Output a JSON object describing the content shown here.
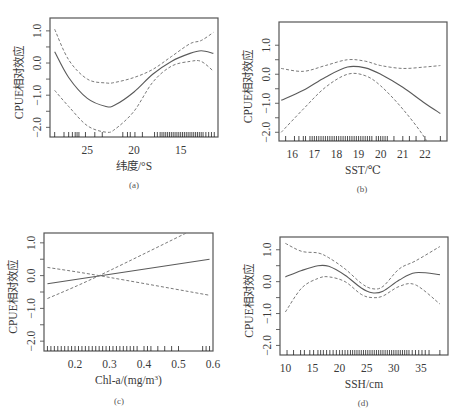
{
  "figure": {
    "captions": [
      "(a)",
      "(b)",
      "(c)",
      "(d)"
    ]
  },
  "chart_data": [
    {
      "type": "line",
      "panel": "(a)",
      "xlabel": "纬度/°S",
      "ylabel": "CPUE相对效应",
      "x_ticks": [
        25,
        20,
        15
      ],
      "y_ticks": [
        "-2.0",
        "-1.0",
        "0.0",
        "1.0"
      ],
      "x_reversed": true,
      "xlim": [
        29,
        11
      ],
      "ylim": [
        -2.3,
        1.4
      ],
      "series": [
        {
          "name": "fit",
          "x": [
            28.5,
            27,
            25,
            23,
            22,
            20,
            18,
            16,
            14,
            12.8,
            11.5
          ],
          "values": [
            0.35,
            -0.45,
            -1.1,
            -1.35,
            -1.3,
            -0.9,
            -0.35,
            0.05,
            0.3,
            0.38,
            0.3
          ]
        },
        {
          "name": "upper",
          "x": [
            28.5,
            27,
            25,
            23,
            22,
            20,
            18,
            16,
            14,
            12.8,
            11.5
          ],
          "values": [
            1.05,
            0.1,
            -0.5,
            -0.62,
            -0.6,
            -0.45,
            -0.2,
            0.2,
            0.6,
            0.7,
            0.95
          ]
        },
        {
          "name": "lower",
          "x": [
            28.5,
            27,
            25,
            23,
            22,
            20,
            18,
            16,
            14,
            12.8,
            11.5
          ],
          "values": [
            -0.85,
            -1.35,
            -1.95,
            -2.15,
            -2.05,
            -1.5,
            -0.6,
            -0.1,
            0.05,
            0.05,
            -0.25
          ]
        }
      ],
      "rug": "dense 17-11, sparse 28-19"
    },
    {
      "type": "line",
      "panel": "(b)",
      "xlabel": "SST/℃",
      "ylabel": "CPUE相对效应",
      "x_ticks": [
        16,
        17,
        18,
        19,
        20,
        21,
        22
      ],
      "y_ticks": [
        "-2.0",
        "-1.0",
        "0.0",
        "1.0"
      ],
      "xlim": [
        15.4,
        23
      ],
      "ylim": [
        -2.3,
        1.8
      ],
      "series": [
        {
          "name": "fit",
          "x": [
            15.5,
            16.5,
            17.5,
            18.5,
            19.3,
            20,
            21,
            22,
            22.7
          ],
          "values": [
            -0.9,
            -0.55,
            -0.1,
            0.25,
            0.22,
            0.0,
            -0.45,
            -1.0,
            -1.35
          ]
        },
        {
          "name": "upper",
          "x": [
            15.5,
            16.5,
            17.5,
            18.5,
            19.3,
            20,
            21,
            22,
            22.7
          ],
          "values": [
            0.2,
            0.1,
            0.3,
            0.5,
            0.45,
            0.3,
            0.2,
            0.25,
            0.3
          ]
        },
        {
          "name": "lower",
          "x": [
            15.5,
            16.5,
            17.5,
            18.5,
            19.3,
            20,
            21,
            22,
            22.7
          ],
          "values": [
            -2.0,
            -1.2,
            -0.45,
            0.0,
            -0.05,
            -0.4,
            -1.2,
            -2.2,
            -3.2
          ]
        }
      ],
      "rug": "dense 16-20.3, sparse 20.3-22.7"
    },
    {
      "type": "line",
      "panel": "(c)",
      "xlabel": "Chl-a/(mg/m³)",
      "ylabel": "CPUE相对效应",
      "x_ticks": [
        0.2,
        0.3,
        0.4,
        0.5,
        0.6
      ],
      "y_ticks": [
        "-2.0",
        "-1.0",
        "0.0",
        "1.0"
      ],
      "xlim": [
        0.11,
        0.6
      ],
      "ylim": [
        -2.3,
        1.3
      ],
      "series": [
        {
          "name": "fit",
          "x": [
            0.12,
            0.59
          ],
          "values": [
            -0.25,
            0.5
          ]
        },
        {
          "name": "upper",
          "x": [
            0.12,
            0.27,
            0.59
          ],
          "values": [
            -0.7,
            0.0,
            1.65
          ]
        },
        {
          "name": "lower",
          "x": [
            0.12,
            0.27,
            0.59
          ],
          "values": [
            0.25,
            0.0,
            -0.6
          ]
        }
      ],
      "rug": "dense 0.12-0.42, sparse to 0.59"
    },
    {
      "type": "line",
      "panel": "(d)",
      "xlabel": "SSH/cm",
      "ylabel": "CPUE相对效应",
      "x_ticks": [
        10,
        15,
        20,
        25,
        30,
        35
      ],
      "y_ticks": [
        "-2.0",
        "-1.0",
        "0.0",
        "1.0"
      ],
      "xlim": [
        9,
        40
      ],
      "ylim": [
        -2.3,
        1.4
      ],
      "series": [
        {
          "name": "fit",
          "x": [
            10,
            13,
            16,
            18,
            21,
            24,
            26,
            28,
            31,
            34,
            38.5
          ],
          "values": [
            0.15,
            0.35,
            0.5,
            0.48,
            0.2,
            -0.2,
            -0.35,
            -0.3,
            0.05,
            0.28,
            0.22
          ]
        },
        {
          "name": "upper",
          "x": [
            10,
            13,
            16,
            18,
            21,
            24,
            26,
            28,
            31,
            34,
            38.5
          ],
          "values": [
            1.2,
            0.95,
            0.9,
            0.75,
            0.4,
            -0.05,
            -0.22,
            -0.15,
            0.4,
            0.65,
            1.1
          ]
        },
        {
          "name": "lower",
          "x": [
            10,
            13,
            16,
            18,
            21,
            24,
            26,
            28,
            31,
            34,
            38.5
          ],
          "values": [
            -0.95,
            -0.2,
            0.1,
            0.15,
            0.0,
            -0.4,
            -0.5,
            -0.45,
            -0.15,
            -0.1,
            -0.7
          ]
        }
      ],
      "rug": "dense 20-33, sparse 10-20 and 33-38"
    }
  ]
}
